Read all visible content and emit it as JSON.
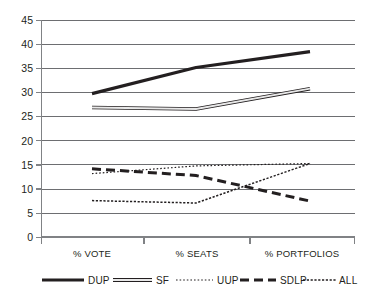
{
  "chart_data": {
    "type": "line",
    "title": "",
    "xlabel": "",
    "ylabel": "",
    "categories": [
      "% VOTE",
      "% SEATS",
      "% PORTFOLIOS"
    ],
    "ylim": [
      0,
      45
    ],
    "yticks": [
      0,
      5,
      10,
      15,
      20,
      25,
      30,
      35,
      40,
      45
    ],
    "grid": true,
    "legend_position": "bottom",
    "series": [
      {
        "name": "DUP",
        "values": [
          29.8,
          35.2,
          38.5
        ],
        "style": "solid-thick"
      },
      {
        "name": "SF",
        "values": [
          26.9,
          26.6,
          30.8
        ],
        "style": "hollow-band"
      },
      {
        "name": "UUP",
        "values": [
          13.2,
          14.8,
          15.3
        ],
        "style": "fine-dotted"
      },
      {
        "name": "SDLP",
        "values": [
          14.2,
          12.8,
          7.5
        ],
        "style": "dashed-thick"
      },
      {
        "name": "ALL",
        "values": [
          7.6,
          7.1,
          15.3
        ],
        "style": "dense-dash"
      }
    ]
  },
  "axis": {
    "y_tick_labels": [
      "45",
      "40",
      "35",
      "30",
      "25",
      "20",
      "15",
      "10",
      "5",
      "0"
    ],
    "x_tick_labels": [
      "% VOTE",
      "% SEATS",
      "% PORTFOLIOS"
    ]
  },
  "legend": {
    "items": [
      {
        "label": "DUP"
      },
      {
        "label": "SF"
      },
      {
        "label": "UUP"
      },
      {
        "label": "SDLP"
      },
      {
        "label": "ALL"
      }
    ]
  },
  "colors": {
    "ink": "#231f20",
    "grid": "#6d6e71",
    "axis": "#808285",
    "background": "#ffffff"
  }
}
